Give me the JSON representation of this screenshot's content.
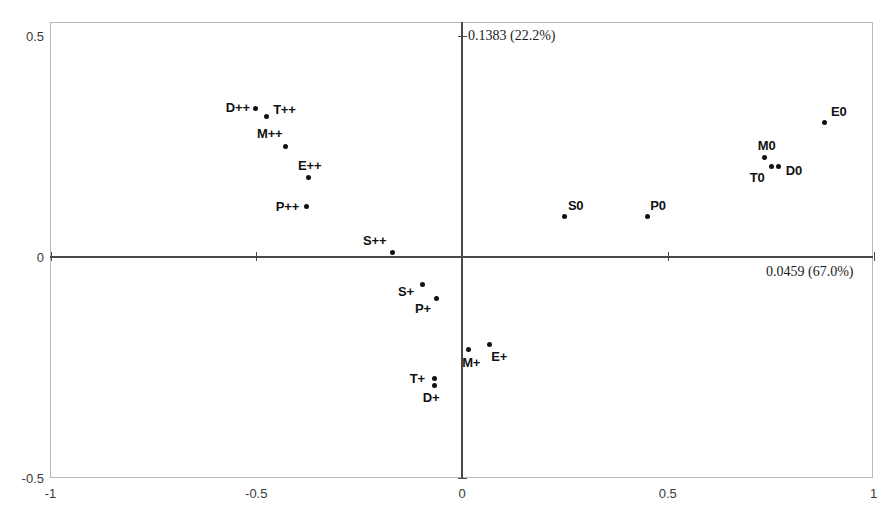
{
  "chart_data": {
    "type": "scatter",
    "title": "",
    "subtitle": "",
    "xlabel": "0.0459 (67.0%)",
    "ylabel": "0.1383 (22.2%)",
    "xlim": [
      -1,
      1
    ],
    "ylim": [
      -0.5,
      0.5
    ],
    "xticks": [
      "-1",
      "-0.5",
      "0",
      "0.5",
      "1"
    ],
    "xtick_values": [
      -1,
      -0.5,
      0,
      0.5,
      1
    ],
    "yticks": [
      "0.5",
      "0",
      "-0.5"
    ],
    "ytick_values": [
      0.5,
      0,
      -0.5
    ],
    "grid": false,
    "legend": "none",
    "axis_annotations": {
      "vertical_axis": "0.1383 (22.2%)",
      "horizontal_axis": "0.0459 (67.0%)"
    },
    "points": [
      {
        "label": "D++",
        "x": -0.501,
        "y": 0.337,
        "label_dx": -30,
        "label_dy": -8
      },
      {
        "label": "T++",
        "x": -0.476,
        "y": 0.319,
        "label_dx": 7,
        "label_dy": -14
      },
      {
        "label": "M++",
        "x": -0.43,
        "y": 0.251,
        "label_dx": -28,
        "label_dy": -20
      },
      {
        "label": "E++",
        "x": -0.374,
        "y": 0.179,
        "label_dx": -10,
        "label_dy": -20
      },
      {
        "label": "P++",
        "x": -0.377,
        "y": 0.115,
        "label_dx": -31,
        "label_dy": -7
      },
      {
        "label": "S++",
        "x": -0.17,
        "y": 0.011,
        "label_dx": -29,
        "label_dy": -19
      },
      {
        "label": "S+",
        "x": -0.097,
        "y": -0.063,
        "label_dx": -24,
        "label_dy": -1
      },
      {
        "label": "P+",
        "x": -0.063,
        "y": -0.093,
        "label_dx": -21,
        "label_dy": 3
      },
      {
        "label": "M+",
        "x": 0.015,
        "y": -0.21,
        "label_dx": -6,
        "label_dy": 5
      },
      {
        "label": "E+",
        "x": 0.066,
        "y": -0.197,
        "label_dx": 2,
        "label_dy": 5
      },
      {
        "label": "T+",
        "x": -0.066,
        "y": -0.274,
        "label_dx": -25,
        "label_dy": -7
      },
      {
        "label": "D+",
        "x": -0.066,
        "y": -0.29,
        "label_dx": -12,
        "label_dy": 5
      },
      {
        "label": "S0",
        "x": 0.25,
        "y": 0.091,
        "label_dx": 3,
        "label_dy": -19
      },
      {
        "label": "P0",
        "x": 0.45,
        "y": 0.091,
        "label_dx": 3,
        "label_dy": -19
      },
      {
        "label": "M0",
        "x": 0.736,
        "y": 0.224,
        "label_dx": -7,
        "label_dy": -20
      },
      {
        "label": "T0",
        "x": 0.753,
        "y": 0.204,
        "label_dx": -22,
        "label_dy": 3
      },
      {
        "label": "D0",
        "x": 0.77,
        "y": 0.204,
        "label_dx": 7,
        "label_dy": -4
      },
      {
        "label": "E0",
        "x": 0.882,
        "y": 0.305,
        "label_dx": 6,
        "label_dy": -18
      }
    ]
  }
}
